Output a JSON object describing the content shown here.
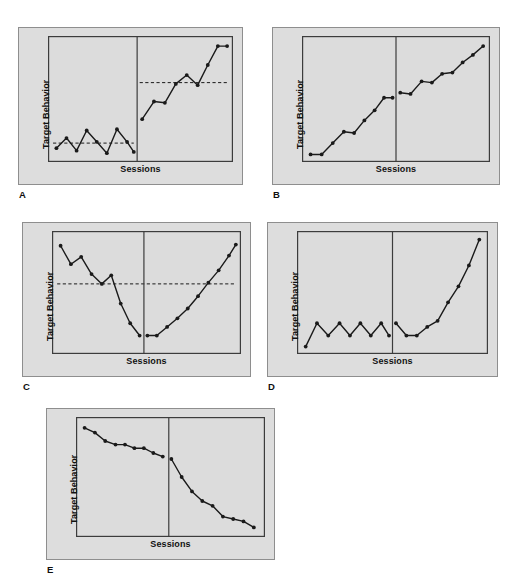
{
  "figure": {
    "background_color": "#ffffff",
    "panel_fill": "#dddddd",
    "panel_border": "#8e8e8e",
    "plot_fill": "#dcdcdc",
    "plot_border": "#3c3c3c",
    "line_color": "#1a1a1a",
    "marker_color": "#1a1a1a",
    "criterion_line_color": "#1a1a1a",
    "axis_label_y": "Target Behavior",
    "axis_label_x": "Sessions",
    "panel_letters": [
      "A",
      "B",
      "C",
      "D",
      "E"
    ]
  },
  "chart_data": [
    {
      "type": "line",
      "panel": "A",
      "title": "",
      "xlabel": "Sessions",
      "ylabel": "Target Behavior",
      "xlim": [
        0,
        22
      ],
      "ylim": [
        0,
        100
      ],
      "grid": false,
      "legend": "none",
      "phase_change_x": 10.6,
      "criterion_lines": [
        {
          "style": "dashed",
          "phase": "baseline",
          "y": 15,
          "x_start": 0.6,
          "x_end": 10.2
        },
        {
          "style": "dashed",
          "phase": "treatment",
          "y": 63,
          "x_start": 10.9,
          "x_end": 21.4
        }
      ],
      "series": [
        {
          "name": "Baseline",
          "x": [
            1.0,
            2.2,
            3.4,
            4.6,
            5.8,
            7.0,
            8.2,
            9.4,
            10.2
          ],
          "y": [
            11,
            19,
            9,
            25,
            16,
            7,
            26,
            16,
            8
          ]
        },
        {
          "name": "Treatment",
          "x": [
            11.2,
            12.6,
            13.9,
            15.2,
            16.5,
            17.8,
            19.0,
            20.2,
            21.3
          ],
          "y": [
            34,
            48,
            47,
            62,
            69,
            61,
            77,
            92,
            92
          ]
        }
      ]
    },
    {
      "type": "line",
      "panel": "B",
      "title": "",
      "xlabel": "Sessions",
      "ylabel": "Target Behavior",
      "xlim": [
        0,
        22
      ],
      "ylim": [
        0,
        100
      ],
      "grid": false,
      "legend": "none",
      "phase_change_x": 11.0,
      "criterion_lines": [],
      "series": [
        {
          "name": "Baseline",
          "x": [
            1.0,
            2.3,
            3.6,
            4.9,
            6.1,
            7.3,
            8.5,
            9.6,
            10.6
          ],
          "y": [
            6,
            6,
            15,
            24,
            23,
            33,
            41,
            51,
            51
          ]
        },
        {
          "name": "Treatment",
          "x": [
            11.5,
            12.7,
            14.0,
            15.2,
            16.4,
            17.6,
            18.8,
            20.0,
            21.2
          ],
          "y": [
            55,
            54,
            64,
            63,
            70,
            71,
            79,
            85,
            92
          ]
        }
      ]
    },
    {
      "type": "line",
      "panel": "C",
      "title": "",
      "xlabel": "Sessions",
      "ylabel": "Target Behavior",
      "xlim": [
        0,
        22
      ],
      "ylim": [
        0,
        100
      ],
      "grid": false,
      "legend": "none",
      "phase_change_x": 10.7,
      "criterion_lines": [
        {
          "style": "dashed",
          "phase": "full",
          "y": 57,
          "x_start": 0.6,
          "x_end": 21.4
        }
      ],
      "series": [
        {
          "name": "Baseline",
          "x": [
            1.0,
            2.2,
            3.4,
            4.6,
            5.8,
            6.9,
            8.0,
            9.1,
            10.2
          ],
          "y": [
            88,
            73,
            79,
            65,
            57,
            64,
            41,
            25,
            15
          ]
        },
        {
          "name": "Treatment",
          "x": [
            11.1,
            12.2,
            13.4,
            14.6,
            15.8,
            17.0,
            18.2,
            19.4,
            20.6,
            21.4
          ],
          "y": [
            15,
            15,
            22,
            29,
            37,
            47,
            58,
            68,
            80,
            89
          ]
        }
      ]
    },
    {
      "type": "line",
      "panel": "D",
      "title": "",
      "xlabel": "Sessions",
      "ylabel": "Target Behavior",
      "xlim": [
        0,
        22
      ],
      "ylim": [
        0,
        100
      ],
      "grid": false,
      "legend": "none",
      "phase_change_x": 11.0,
      "criterion_lines": [],
      "series": [
        {
          "name": "Baseline",
          "x": [
            1.0,
            2.3,
            3.6,
            4.9,
            6.1,
            7.3,
            8.5,
            9.7,
            10.6
          ],
          "y": [
            6,
            25,
            15,
            25,
            15,
            25,
            15,
            25,
            15
          ]
        },
        {
          "name": "Treatment",
          "x": [
            11.4,
            12.6,
            13.8,
            15.0,
            16.2,
            17.4,
            18.6,
            19.8,
            21.0
          ],
          "y": [
            25,
            15,
            15,
            22,
            27,
            42,
            55,
            72,
            93
          ]
        }
      ]
    },
    {
      "type": "line",
      "panel": "E",
      "title": "",
      "xlabel": "Sessions",
      "ylabel": "Target Behavior",
      "xlim": [
        0,
        22
      ],
      "ylim": [
        0,
        100
      ],
      "grid": false,
      "legend": "none",
      "phase_change_x": 10.8,
      "criterion_lines": [],
      "series": [
        {
          "name": "Baseline",
          "x": [
            1.0,
            2.2,
            3.4,
            4.6,
            5.7,
            6.8,
            7.9,
            9.0,
            10.1
          ],
          "y": [
            91,
            87,
            80,
            77,
            77,
            74,
            74,
            70,
            67
          ]
        },
        {
          "name": "Treatment",
          "x": [
            11.1,
            12.3,
            13.5,
            14.7,
            15.9,
            17.1,
            18.3,
            19.5,
            20.7
          ],
          "y": [
            65,
            50,
            38,
            30,
            26,
            17,
            15,
            13,
            8
          ]
        }
      ]
    }
  ],
  "panels": [
    {
      "id": "A",
      "letter": "A",
      "y_axis_label": "Target Behavior",
      "x_axis_label": "Sessions"
    },
    {
      "id": "B",
      "letter": "B",
      "y_axis_label": "Target Behavior",
      "x_axis_label": "Sessions"
    },
    {
      "id": "C",
      "letter": "C",
      "y_axis_label": "Target Behavior",
      "x_axis_label": "Sessions"
    },
    {
      "id": "D",
      "letter": "D",
      "y_axis_label": "Target Behavior",
      "x_axis_label": "Sessions"
    },
    {
      "id": "E",
      "letter": "E",
      "y_axis_label": "Target Behavior",
      "x_axis_label": "Sessions"
    }
  ]
}
